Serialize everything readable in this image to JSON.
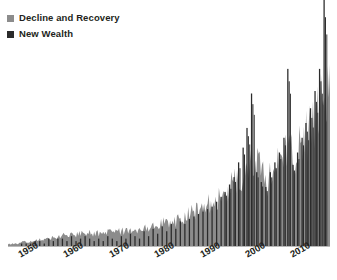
{
  "legend": {
    "position": "top-left",
    "items": [
      {
        "label": "Decline and Recovery",
        "color": "#8c8c8c",
        "icon": "square-marker-icon"
      },
      {
        "label": "New Wealth",
        "color": "#2b2b2b",
        "icon": "square-marker-icon"
      }
    ]
  },
  "axis": {
    "x_tick_labels": [
      "1950",
      "1960",
      "1970",
      "1980",
      "1990",
      "2000",
      "2010"
    ],
    "x_tick_values": [
      1950,
      1960,
      1970,
      1980,
      1990,
      2000,
      2010
    ],
    "xlim": [
      1946,
      2017
    ],
    "ylim": [
      0,
      100
    ],
    "grid": false,
    "y_axis_visible": false,
    "axis_color": "#b9b9b9"
  },
  "chart_data": {
    "type": "bar",
    "title": "",
    "subtitle": "",
    "xlabel": "",
    "ylabel": "",
    "xlim": [
      1946,
      2017
    ],
    "ylim": [
      0,
      100
    ],
    "grid": false,
    "legend_position": "top-left",
    "stacked": true,
    "note": "Annual values 1946-2016. Gray area = Decline and Recovery (broad envelope). Black spikes = New Wealth (narrow tall bars). Values are percent of chart height; topmost 2016 spike is clipped by the image frame.",
    "x": [
      1946,
      1947,
      1948,
      1949,
      1950,
      1951,
      1952,
      1953,
      1954,
      1955,
      1956,
      1957,
      1958,
      1959,
      1960,
      1961,
      1962,
      1963,
      1964,
      1965,
      1966,
      1967,
      1968,
      1969,
      1970,
      1971,
      1972,
      1973,
      1974,
      1975,
      1976,
      1977,
      1978,
      1979,
      1980,
      1981,
      1982,
      1983,
      1984,
      1985,
      1986,
      1987,
      1988,
      1989,
      1990,
      1991,
      1992,
      1993,
      1994,
      1995,
      1996,
      1997,
      1998,
      1999,
      2000,
      2001,
      2002,
      2003,
      2004,
      2005,
      2006,
      2007,
      2008,
      2009,
      2010,
      2011,
      2012,
      2013,
      2014,
      2015,
      2016
    ],
    "series": [
      {
        "name": "Decline and Recovery",
        "color": "#8c8c8c",
        "values": [
          1,
          1,
          1,
          2,
          2,
          2,
          3,
          3,
          3,
          4,
          4,
          4,
          5,
          5,
          5,
          5,
          6,
          6,
          6,
          6,
          6,
          6,
          7,
          7,
          7,
          7,
          7,
          8,
          8,
          8,
          9,
          9,
          10,
          10,
          11,
          11,
          12,
          12,
          13,
          14,
          15,
          16,
          17,
          18,
          19,
          20,
          21,
          23,
          25,
          27,
          29,
          32,
          35,
          38,
          42,
          38,
          33,
          31,
          34,
          37,
          40,
          44,
          47,
          40,
          44,
          48,
          52,
          56,
          60,
          66,
          74
        ]
      },
      {
        "name": "New Wealth",
        "color": "#2b2b2b",
        "values": [
          0,
          0,
          0,
          1,
          1,
          1,
          2,
          2,
          1,
          3,
          2,
          3,
          3,
          2,
          4,
          2,
          3,
          4,
          3,
          2,
          3,
          2,
          4,
          3,
          2,
          4,
          3,
          5,
          4,
          3,
          6,
          4,
          7,
          5,
          8,
          6,
          9,
          7,
          10,
          9,
          11,
          12,
          13,
          14,
          15,
          16,
          18,
          20,
          22,
          25,
          28,
          34,
          40,
          48,
          62,
          30,
          26,
          24,
          30,
          34,
          38,
          44,
          72,
          33,
          38,
          44,
          50,
          56,
          63,
          72,
          100
        ]
      }
    ]
  }
}
